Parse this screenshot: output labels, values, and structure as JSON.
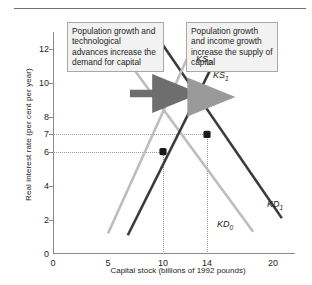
{
  "chart_data": {
    "type": "line",
    "title": "",
    "xlabel": "Capital stock (billions of 1992 pounds)",
    "ylabel": "Real interest rate (per cent per year)",
    "xlim": [
      0,
      22
    ],
    "ylim": [
      0,
      13
    ],
    "grid": "dotted guide lines at equilibria only",
    "legend": "inline curve labels",
    "xticks": [
      "0",
      "5",
      "10",
      "14",
      "20"
    ],
    "xtick_values": [
      0,
      5,
      10,
      14,
      20
    ],
    "yticks": [
      "0",
      "2",
      "4",
      "6",
      "7",
      "8",
      "10",
      "12"
    ],
    "ytick_values": [
      0,
      2,
      4,
      6,
      7,
      8,
      10,
      12
    ],
    "series": [
      {
        "name": "KD0",
        "label": "KD",
        "subscript": "0",
        "role": "demand for capital (initial)",
        "color": "#bdbdbd",
        "points": [
          [
            6.0,
            12.0
          ],
          [
            18.2,
            1.3
          ]
        ]
      },
      {
        "name": "KD1",
        "label": "KD",
        "subscript": "1",
        "role": "demand for capital (after increase)",
        "color": "#3b3b3b",
        "points": [
          [
            9.6,
            12.6
          ],
          [
            20.8,
            2.1
          ]
        ]
      },
      {
        "name": "KS0",
        "label": "KS",
        "subscript": "0",
        "role": "supply of capital (initial)",
        "color": "#bdbdbd",
        "points": [
          [
            5.0,
            1.2
          ],
          [
            13.0,
            12.6
          ]
        ]
      },
      {
        "name": "KS1",
        "label": "KS",
        "subscript": "1",
        "role": "supply of capital (after increase)",
        "color": "#3b3b3b",
        "points": [
          [
            6.8,
            1.1
          ],
          [
            15.4,
            12.2
          ]
        ]
      }
    ],
    "equilibria": [
      {
        "name": "initial-equilibrium",
        "x": 10,
        "y": 6,
        "color": "#1a1a1a"
      },
      {
        "name": "new-equilibrium",
        "x": 14,
        "y": 7,
        "color": "#1a1a1a"
      }
    ],
    "guide_lines": {
      "horizontal": [
        6,
        7
      ],
      "vertical": [
        10,
        14
      ]
    },
    "shift_arrows": [
      {
        "name": "demand-shift-arrow",
        "from_x": 7.0,
        "to_x": 11.2,
        "y": 9.4
      },
      {
        "name": "supply-shift-arrow",
        "from_x": 12.3,
        "to_x": 14.4,
        "y": 9.2
      }
    ]
  },
  "callouts": {
    "demand": "Population growth and technological advances increase the demand for capital",
    "supply": "Population growth and income growth increase the supply of capital"
  }
}
